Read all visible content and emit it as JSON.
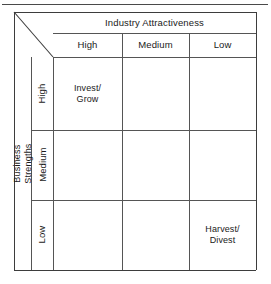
{
  "figure": {
    "name": "industry-attractiveness-business-strengths-matrix",
    "column_axis_title": "Industry Attractiveness",
    "row_axis_title": "Business Strengths",
    "column_headers": [
      "High",
      "Medium",
      "Low"
    ],
    "row_headers": [
      "High",
      "Medium",
      "Low"
    ],
    "cells": [
      {
        "row": "High",
        "column": "High",
        "text": "Invest/\nGrow"
      },
      {
        "row": "High",
        "column": "Medium",
        "text": ""
      },
      {
        "row": "High",
        "column": "Low",
        "text": ""
      },
      {
        "row": "Medium",
        "column": "High",
        "text": ""
      },
      {
        "row": "Medium",
        "column": "Medium",
        "text": ""
      },
      {
        "row": "Medium",
        "column": "Low",
        "text": ""
      },
      {
        "row": "Low",
        "column": "High",
        "text": ""
      },
      {
        "row": "Low",
        "column": "Medium",
        "text": ""
      },
      {
        "row": "Low",
        "column": "Low",
        "text": "Harvest/\nDivest"
      }
    ],
    "colors": {
      "line": "#555555",
      "line_strong": "#3d3d3d",
      "text": "#1a1a1a",
      "background": "#ffffff"
    }
  }
}
